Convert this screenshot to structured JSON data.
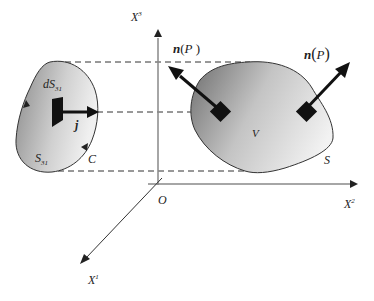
{
  "diagram": {
    "axes": {
      "x1": {
        "label": "X",
        "sup": "1"
      },
      "x2": {
        "label": "X",
        "sup": "2"
      },
      "x3": {
        "label": "X",
        "sup": "3"
      },
      "origin": "O"
    },
    "projection": {
      "area_element_label": "dS",
      "area_element_sub": "31",
      "surface_label": "S",
      "surface_sub": "31",
      "curve_label": "C",
      "unit_vector_label": "j"
    },
    "body": {
      "volume_label": "V",
      "surface_label": "S"
    },
    "normals": [
      {
        "label": "n",
        "arg": "P"
      },
      {
        "label": "n",
        "arg": "P"
      }
    ]
  }
}
